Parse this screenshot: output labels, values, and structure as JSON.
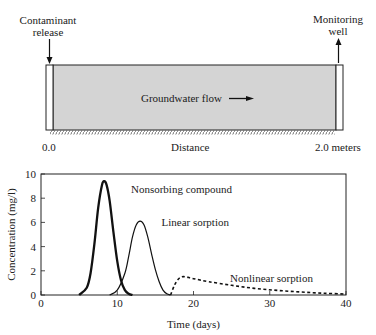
{
  "diagram": {
    "release_label_line1": "Contaminant",
    "release_label_line2": "release",
    "well_label_line1": "Monitoring",
    "well_label_line2": "well",
    "flow_label": "Groundwater flow",
    "axis_start": "0.0",
    "axis_label": "Distance",
    "axis_end": "2.0 meters",
    "aquifer_color": "#d4d4d4"
  },
  "chart_data": {
    "type": "line",
    "title": "",
    "xlabel": "Time (days)",
    "ylabel": "Concentration (mg/l)",
    "xlim": [
      0,
      40
    ],
    "ylim": [
      0,
      10
    ],
    "xticks": [
      0,
      10,
      20,
      30,
      40
    ],
    "yticks": [
      0,
      2,
      4,
      6,
      8,
      10
    ],
    "grid": false,
    "legend": "none",
    "series": [
      {
        "name": "Nonsorbing compound",
        "style": "solid-thick",
        "x": [
          5.0,
          6.0,
          6.5,
          7.0,
          7.5,
          8.0,
          8.3,
          8.6,
          9.0,
          9.5,
          10.0,
          10.5,
          11.0,
          11.5,
          12.0
        ],
        "y": [
          0.0,
          0.6,
          1.8,
          4.2,
          7.2,
          9.1,
          9.4,
          9.1,
          7.8,
          5.2,
          2.8,
          1.2,
          0.4,
          0.1,
          0.0
        ]
      },
      {
        "name": "Linear sorption",
        "style": "solid",
        "x": [
          9.0,
          10.0,
          11.0,
          11.5,
          12.0,
          12.5,
          13.0,
          13.5,
          14.0,
          14.5,
          15.0,
          15.5,
          16.0,
          16.5,
          17.0
        ],
        "y": [
          0.0,
          0.4,
          1.8,
          3.2,
          4.8,
          5.8,
          6.1,
          5.8,
          4.8,
          3.4,
          2.1,
          1.1,
          0.4,
          0.1,
          0.0
        ]
      },
      {
        "name": "Nonlinear sorption",
        "style": "dashed",
        "x": [
          17.0,
          17.5,
          18.0,
          18.5,
          19.0,
          20.0,
          22.0,
          25.0,
          28.0,
          31.0,
          34.0,
          37.0,
          40.0
        ],
        "y": [
          0.0,
          0.8,
          1.3,
          1.5,
          1.5,
          1.35,
          1.1,
          0.8,
          0.55,
          0.38,
          0.25,
          0.15,
          0.08
        ]
      }
    ],
    "annotations": [
      {
        "text": "Nonsorbing compound",
        "x": 11.8,
        "y": 8.8
      },
      {
        "text": "Linear sorption",
        "x": 15.8,
        "y": 6.0
      },
      {
        "text": "Nonlinear sorption",
        "x": 24.8,
        "y": 1.4
      }
    ]
  }
}
